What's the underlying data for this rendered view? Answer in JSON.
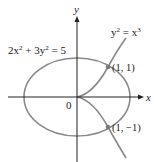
{
  "figure": {
    "axes": {
      "x_label": "x",
      "y_label": "y",
      "origin_label": "0"
    },
    "curves": [
      {
        "name": "ellipse",
        "equation_parts": [
          "2x",
          "2",
          " + 3y",
          "2",
          " = 5"
        ]
      },
      {
        "name": "semicubical-parabola",
        "equation_parts": [
          "y",
          "2",
          " = x",
          "3"
        ]
      }
    ],
    "points": [
      {
        "label": "(1, 1)",
        "x": 1,
        "y": 1
      },
      {
        "label": "(1, −1)",
        "x": 1,
        "y": -1
      }
    ],
    "colors": {
      "axis": "#222222",
      "curve": "#8a8a8a",
      "point": "#7a7a7a",
      "text": "#222222"
    }
  }
}
